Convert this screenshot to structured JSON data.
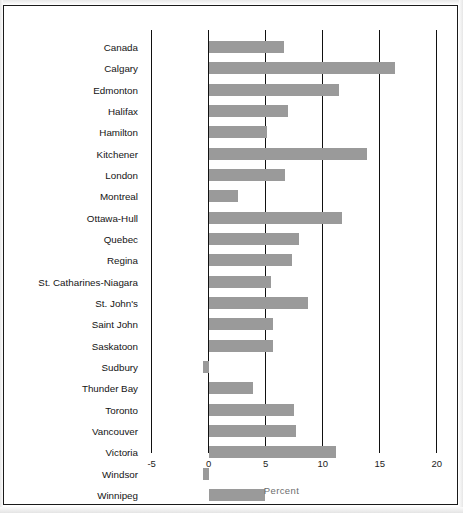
{
  "chart_data": {
    "type": "bar",
    "orientation": "horizontal",
    "title": "",
    "subtitle": "",
    "xlabel": "Percent",
    "ylabel": "",
    "xlim": [
      -5,
      20
    ],
    "xticks": [
      -5,
      0,
      5,
      10,
      15,
      20
    ],
    "xtick_labels": [
      "-5",
      "0",
      "5",
      "10",
      "15",
      "20"
    ],
    "grid": "vertical gridlines at each x tick",
    "legend": "none",
    "bar_color": "#9a9a9a",
    "axis_color": "#111111",
    "categories": [
      "Canada",
      "Calgary",
      "Edmonton",
      "Halifax",
      "Hamilton",
      "Kitchener",
      "London",
      "Montreal",
      "Ottawa-Hull",
      "Quebec",
      "Regina",
      "St. Catharines-Niagara",
      "St. John's",
      "Saint John",
      "Saskatoon",
      "Sudbury",
      "Thunder Bay",
      "Toronto",
      "Vancouver",
      "Victoria",
      "Windsor",
      "Winnipeg"
    ],
    "values": [
      6.6,
      16.3,
      11.4,
      7.0,
      5.1,
      13.9,
      6.7,
      2.6,
      11.7,
      7.9,
      7.3,
      5.5,
      8.7,
      5.6,
      5.6,
      -0.5,
      3.9,
      7.5,
      7.7,
      11.2,
      -0.5,
      4.9
    ]
  }
}
